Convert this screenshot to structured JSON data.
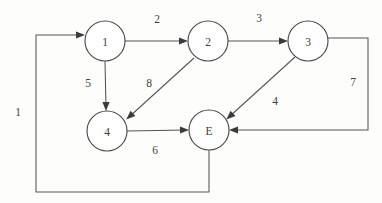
{
  "diagram": {
    "background_color": "#fdfdfc",
    "stroke_color": "#545454",
    "text_color": "#3c3c3c",
    "nodes": [
      {
        "id": "n1",
        "label": "1",
        "cx": 105,
        "cy": 41,
        "r": 20
      },
      {
        "id": "n2",
        "label": "2",
        "cx": 208,
        "cy": 41,
        "r": 20
      },
      {
        "id": "n3",
        "label": "3",
        "cx": 308,
        "cy": 41,
        "r": 20
      },
      {
        "id": "n4",
        "label": "4",
        "cx": 107,
        "cy": 131,
        "r": 20
      },
      {
        "id": "nE",
        "label": "E",
        "cx": 209,
        "cy": 130,
        "r": 20
      }
    ],
    "edges": [
      {
        "id": "e1",
        "from": "E",
        "to": "1",
        "label": "1",
        "label_x": 18,
        "label_y": 112
      },
      {
        "id": "e2",
        "from": "1",
        "to": "2",
        "label": "2",
        "label_x": 157,
        "label_y": 19
      },
      {
        "id": "e3",
        "from": "2",
        "to": "3",
        "label": "3",
        "label_x": 259,
        "label_y": 18
      },
      {
        "id": "e5",
        "from": "1",
        "to": "4",
        "label": "5",
        "label_x": 88,
        "label_y": 83
      },
      {
        "id": "e8",
        "from": "2",
        "to": "4",
        "label": "8",
        "label_x": 149,
        "label_y": 83
      },
      {
        "id": "e6",
        "from": "4",
        "to": "E",
        "label": "6",
        "label_x": 155,
        "label_y": 150
      },
      {
        "id": "e4",
        "from": "3",
        "to": "E",
        "label": "4",
        "label_x": 275,
        "label_y": 101
      },
      {
        "id": "e7",
        "from": "3",
        "to": "E",
        "label": "7",
        "label_x": 353,
        "label_y": 82
      }
    ]
  }
}
